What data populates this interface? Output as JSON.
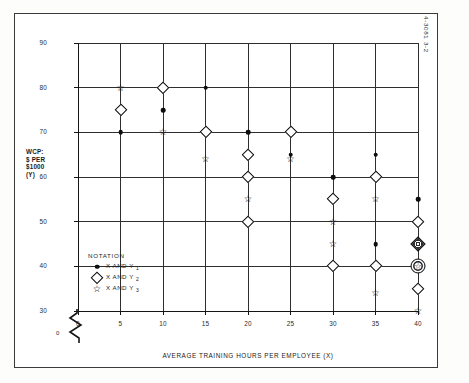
{
  "figure_number": "4-3081 3-2",
  "axes": {
    "x_title": "AVERAGE TRAINING HOURS PER EMPLOYEE (X)",
    "y_title_lines": [
      "WCP:",
      "$ PER",
      "$1000",
      "(Y)"
    ],
    "x_ticks": [
      "0",
      "5",
      "10",
      "15",
      "20",
      "25",
      "30",
      "35",
      "40"
    ],
    "y_ticks": [
      "30",
      "40",
      "50",
      "60",
      "70",
      "80",
      "90"
    ],
    "origin_label": "0"
  },
  "legend": {
    "title": "NOTATION",
    "items": [
      {
        "symbol": "filled-circle",
        "label": "X AND Y",
        "sub": "1"
      },
      {
        "symbol": "open-diamond",
        "label": "X AND Y",
        "sub": "2"
      },
      {
        "symbol": "open-star",
        "label": "X AND Y",
        "sub": "3"
      }
    ]
  },
  "chart_data": {
    "type": "scatter",
    "title": "",
    "xlabel": "AVERAGE TRAINING HOURS PER EMPLOYEE (X)",
    "ylabel": "WCP: $ PER $1000 (Y)",
    "xlim": [
      0,
      40
    ],
    "ylim": [
      30,
      90
    ],
    "xticks": [
      0,
      5,
      10,
      15,
      20,
      25,
      30,
      35,
      40
    ],
    "yticks": [
      30,
      40,
      50,
      60,
      70,
      80,
      90
    ],
    "grid": true,
    "y_axis_break": true,
    "legend_position": "inside-bottom-left",
    "series": [
      {
        "name": "X AND Y1",
        "marker": "filled-circle",
        "points": [
          {
            "x": 5,
            "y": 70
          },
          {
            "x": 10,
            "y": 75
          },
          {
            "x": 15,
            "y": 80
          },
          {
            "x": 20,
            "y": 70
          },
          {
            "x": 25,
            "y": 65
          },
          {
            "x": 30,
            "y": 60
          },
          {
            "x": 35,
            "y": 65
          },
          {
            "x": 35,
            "y": 45
          },
          {
            "x": 40,
            "y": 55
          }
        ]
      },
      {
        "name": "X AND Y2",
        "marker": "open-diamond",
        "points": [
          {
            "x": 5,
            "y": 75
          },
          {
            "x": 10,
            "y": 80
          },
          {
            "x": 15,
            "y": 70
          },
          {
            "x": 20,
            "y": 65
          },
          {
            "x": 20,
            "y": 60
          },
          {
            "x": 20,
            "y": 50
          },
          {
            "x": 25,
            "y": 70
          },
          {
            "x": 30,
            "y": 55
          },
          {
            "x": 30,
            "y": 40
          },
          {
            "x": 35,
            "y": 60
          },
          {
            "x": 35,
            "y": 40
          },
          {
            "x": 40,
            "y": 50
          },
          {
            "x": 40,
            "y": 45
          },
          {
            "x": 40,
            "y": 40
          },
          {
            "x": 40,
            "y": 35
          }
        ]
      },
      {
        "name": "X AND Y3",
        "marker": "open-star",
        "points": [
          {
            "x": 5,
            "y": 80
          },
          {
            "x": 10,
            "y": 70
          },
          {
            "x": 15,
            "y": 64
          },
          {
            "x": 20,
            "y": 55
          },
          {
            "x": 25,
            "y": 64
          },
          {
            "x": 30,
            "y": 50
          },
          {
            "x": 30,
            "y": 45
          },
          {
            "x": 35,
            "y": 55
          },
          {
            "x": 35,
            "y": 34
          },
          {
            "x": 40,
            "y": 45
          },
          {
            "x": 40,
            "y": 40
          },
          {
            "x": 40,
            "y": 30
          }
        ]
      }
    ]
  }
}
